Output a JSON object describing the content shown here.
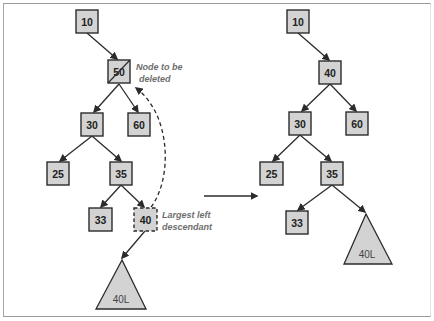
{
  "before_tree": {
    "nodes": {
      "n10": "10",
      "n50": "50",
      "n30": "30",
      "n60": "60",
      "n25": "25",
      "n35": "35",
      "n33": "33",
      "n40": "40"
    },
    "subtree_label": "40L",
    "annotations": {
      "deleted_line1": "Node to be",
      "deleted_line2": "deleted",
      "descendant_line1": "Largest left",
      "descendant_line2": "descendant"
    }
  },
  "after_tree": {
    "nodes": {
      "n10": "10",
      "n40": "40",
      "n30": "30",
      "n60": "60",
      "n25": "25",
      "n35": "35",
      "n33": "33"
    },
    "subtree_label": "40L"
  },
  "colors": {
    "node_fill": "#d3d3d3",
    "node_stroke": "#2b2b2b",
    "annotation_text": "#6e6e6e"
  }
}
